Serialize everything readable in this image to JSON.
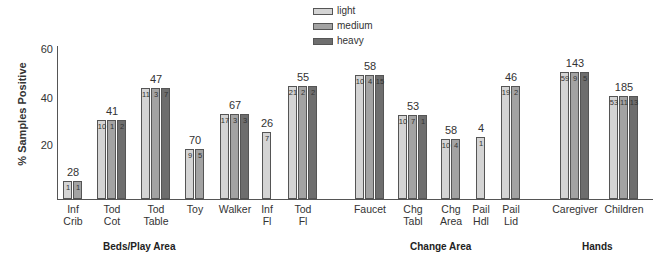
{
  "chart_data": {
    "type": "bar",
    "title": "",
    "xlabel": "",
    "ylabel": "% Samples Positive",
    "ylim": [
      0,
      60
    ],
    "yticks": [
      20,
      40,
      60
    ],
    "grid": false,
    "legend_position": "top-center",
    "series_names": [
      "light",
      "medium",
      "heavy"
    ],
    "colors": {
      "light": "#d4d4d4",
      "medium": "#a3a3a3",
      "heavy": "#6e6e6e"
    },
    "categories": [
      "Inf Crib",
      "Tod Cot",
      "Tod Table",
      "Toy",
      "Walker",
      "Inf Fl",
      "Tod Fl",
      "Faucet",
      "Chg Tabl",
      "Chg Area",
      "Pail Hdl",
      "Pail Lid",
      "Caregiver",
      "Children"
    ],
    "category_labels": [
      "Inf\nCrib",
      "Tod\nCot",
      "Tod\nTable",
      "Toy",
      "Walker",
      "Inf\nFl",
      "Tod\nFl",
      "Faucet",
      "Chg\nTabl",
      "Chg\nArea",
      "Pail\nHdl",
      "Pail\nLid",
      "Caregiver",
      "Children"
    ],
    "totals_n": [
      28,
      41,
      47,
      70,
      67,
      26,
      55,
      58,
      53,
      58,
      4,
      46,
      143,
      185
    ],
    "percent_positive": [
      7.1,
      31.7,
      44.7,
      20.0,
      34.3,
      26.9,
      45.5,
      50.0,
      34.0,
      24.1,
      25.0,
      45.7,
      51.0,
      41.6
    ],
    "series": [
      {
        "name": "light",
        "counts": [
          1,
          10,
          11,
          9,
          17,
          7,
          21,
          10,
          10,
          10,
          1,
          19,
          59,
          53
        ]
      },
      {
        "name": "medium",
        "counts": [
          1,
          1,
          3,
          5,
          3,
          null,
          2,
          4,
          7,
          4,
          null,
          2,
          9,
          11
        ]
      },
      {
        "name": "heavy",
        "counts": [
          null,
          2,
          7,
          null,
          3,
          null,
          2,
          15,
          1,
          null,
          null,
          null,
          5,
          13
        ]
      }
    ],
    "groups": [
      {
        "label": "Beds/Play Area",
        "categories": [
          "Inf Crib",
          "Tod Cot",
          "Tod Table",
          "Toy",
          "Walker",
          "Inf Fl",
          "Tod Fl"
        ]
      },
      {
        "label": "Change Area",
        "categories": [
          "Faucet",
          "Chg Tabl",
          "Chg Area",
          "Pail Hdl",
          "Pail Lid"
        ]
      },
      {
        "label": "Hands",
        "categories": [
          "Caregiver",
          "Children"
        ]
      }
    ]
  },
  "legend": {
    "light": "light",
    "medium": "medium",
    "heavy": "heavy"
  },
  "axis": {
    "ylabel": "% Samples Positive",
    "t60": "60",
    "t40": "40",
    "t20": "20"
  },
  "groups": {
    "beds": "Beds/Play Area",
    "change": "Change Area",
    "hands": "Hands"
  }
}
